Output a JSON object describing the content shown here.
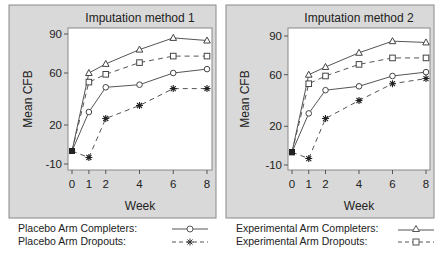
{
  "chart_data": [
    {
      "type": "line",
      "title": "Imputation method 1",
      "xlabel": "Week",
      "ylabel": "Mean CFB",
      "x": [
        0,
        1,
        2,
        4,
        6,
        8
      ],
      "xticks": [
        0,
        1,
        2,
        4,
        6,
        8
      ],
      "yticks": [
        -10,
        20,
        60,
        90
      ],
      "ylim": [
        -14,
        93
      ],
      "grid": false,
      "series": [
        {
          "name": "Placebo Arm Completers",
          "marker": "circle",
          "linestyle": "solid",
          "values": [
            0,
            30,
            49,
            51,
            60,
            63
          ]
        },
        {
          "name": "Placebo Arm Dropouts",
          "marker": "star",
          "linestyle": "dashed",
          "values": [
            0,
            -5,
            25,
            35,
            48,
            48
          ]
        },
        {
          "name": "Experimental Arm Completers",
          "marker": "triangle",
          "linestyle": "solid",
          "values": [
            0,
            60,
            67,
            78,
            87,
            85
          ]
        },
        {
          "name": "Experimental Arm Dropouts",
          "marker": "square",
          "linestyle": "dashed",
          "values": [
            0,
            53,
            59,
            68,
            73,
            73
          ]
        }
      ]
    },
    {
      "type": "line",
      "title": "Imputation method 2",
      "xlabel": "Week",
      "ylabel": "Mean CFB",
      "x": [
        0,
        1,
        2,
        4,
        6,
        8
      ],
      "xticks": [
        0,
        1,
        2,
        4,
        6,
        8
      ],
      "yticks": [
        -10,
        20,
        60,
        90
      ],
      "ylim": [
        -14,
        93
      ],
      "grid": false,
      "series": [
        {
          "name": "Placebo Arm Completers",
          "marker": "circle",
          "linestyle": "solid",
          "values": [
            0,
            30,
            48,
            51,
            59,
            62
          ]
        },
        {
          "name": "Placebo Arm Dropouts",
          "marker": "star",
          "linestyle": "dashed",
          "values": [
            0,
            -5,
            26,
            40,
            53,
            57
          ]
        },
        {
          "name": "Experimental Arm Completers",
          "marker": "triangle",
          "linestyle": "solid",
          "values": [
            0,
            60,
            66,
            77,
            86,
            85
          ]
        },
        {
          "name": "Experimental Arm Dropouts",
          "marker": "square",
          "linestyle": "dashed",
          "values": [
            0,
            53,
            59,
            68,
            73,
            73
          ]
        }
      ]
    }
  ],
  "legend": {
    "left": [
      {
        "label": "Placebo Arm Completers:",
        "marker": "circle",
        "linestyle": "solid"
      },
      {
        "label": "Placebo Arm Dropouts:",
        "marker": "star",
        "linestyle": "dashed"
      }
    ],
    "right": [
      {
        "label": "Experimental Arm Completers:",
        "marker": "triangle",
        "linestyle": "solid"
      },
      {
        "label": "Experimental Arm Dropouts:",
        "marker": "square",
        "linestyle": "dashed"
      }
    ]
  },
  "colors": {
    "panel_bg": "#d9d9d9",
    "plot_bg": "#ffffff",
    "line": "#555555",
    "text": "#222222",
    "border": "#888888"
  }
}
